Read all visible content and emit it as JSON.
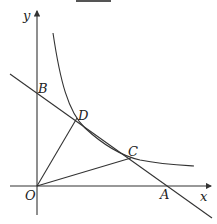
{
  "diagram": {
    "type": "coordinate-geometry",
    "axes": {
      "x_label": "x",
      "y_label": "y",
      "origin_label": "O"
    },
    "points": {
      "O": {
        "label": "O"
      },
      "A": {
        "label": "A"
      },
      "B": {
        "label": "B"
      },
      "C": {
        "label": "C"
      },
      "D": {
        "label": "D"
      }
    },
    "elements": [
      "x-axis",
      "y-axis",
      "hyperbola",
      "line AB",
      "segment OD",
      "segment OC"
    ],
    "colors": {
      "stroke": "#333333",
      "background": "#ffffff"
    }
  }
}
